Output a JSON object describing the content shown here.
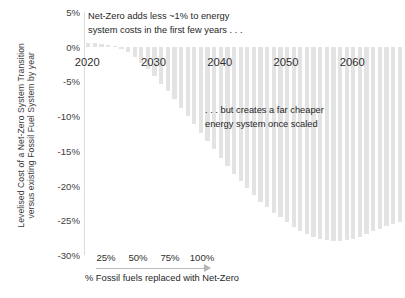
{
  "chart_data": {
    "type": "bar",
    "title": "",
    "xlabel": "",
    "ylabel": "Levelised Cost of a Net-Zero System Transition versus existing Fossil Fuel System by year",
    "ylabel_lines": [
      "Levelised Cost of a Net-Zero System Transition",
      "versus existing Fossil Fuel System by  year"
    ],
    "grid": false,
    "legend": "none",
    "ylim": [
      -30,
      5
    ],
    "ytick_labels": [
      "5%",
      "0%",
      "-5%",
      "-10%",
      "-15%",
      "-20%",
      "-25%",
      "-30%"
    ],
    "ytick_values": [
      5,
      0,
      -5,
      -10,
      -15,
      -20,
      -25,
      -30
    ],
    "xtick_labels": [
      "2020",
      "2030",
      "2040",
      "2050",
      "2060"
    ],
    "xtick_values": [
      2020,
      2030,
      2040,
      2050,
      2060
    ],
    "xlim": [
      2019.5,
      2067.5
    ],
    "bar_color": "#e3e3e3",
    "categories": [
      2020,
      2021,
      2022,
      2023,
      2024,
      2025,
      2026,
      2027,
      2028,
      2029,
      2030,
      2031,
      2032,
      2033,
      2034,
      2035,
      2036,
      2037,
      2038,
      2039,
      2040,
      2041,
      2042,
      2043,
      2044,
      2045,
      2046,
      2047,
      2048,
      2049,
      2050,
      2051,
      2052,
      2053,
      2054,
      2055,
      2056,
      2057,
      2058,
      2059,
      2060,
      2061,
      2062,
      2063,
      2064,
      2065,
      2066,
      2067
    ],
    "values": [
      0.6,
      0.5,
      0.4,
      0.3,
      0.1,
      -0.3,
      -0.8,
      -1.5,
      -2.3,
      -3.2,
      -4.2,
      -5.3,
      -6.4,
      -7.6,
      -8.8,
      -10.0,
      -11.2,
      -12.4,
      -13.6,
      -14.8,
      -16.0,
      -17.2,
      -18.3,
      -19.4,
      -20.4,
      -21.4,
      -22.3,
      -23.1,
      -23.9,
      -24.6,
      -25.3,
      -25.9,
      -26.5,
      -27.0,
      -27.4,
      -27.7,
      -27.9,
      -28.0,
      -28.0,
      -27.9,
      -27.7,
      -27.4,
      -27.0,
      -26.6,
      -26.2,
      -25.8,
      -25.5,
      -25.2
    ],
    "annotations": [
      {
        "name": "top-annotation",
        "lines": [
          "Net-Zero adds less ~1% to energy",
          "system costs in the first few years . . ."
        ]
      },
      {
        "name": "mid-annotation",
        "lines": [
          ". . . but creates a far cheaper",
          "energy system once scaled"
        ]
      }
    ],
    "secondary_axis": {
      "title": "% Fossil fuels replaced with Net-Zero",
      "ticks": [
        "25%",
        "50%",
        "75%",
        "100%"
      ],
      "tick_values": [
        25,
        50,
        75,
        100
      ],
      "arrow": "right-arrow"
    }
  }
}
